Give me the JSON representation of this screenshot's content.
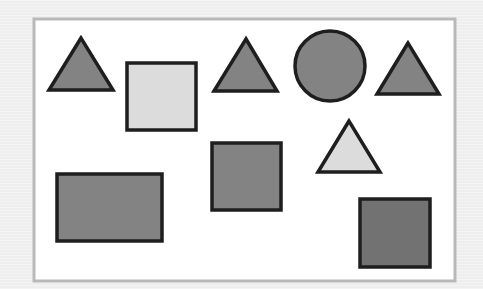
{
  "scene": {
    "background": "#eeeeee",
    "frame": {
      "x": 34,
      "y": 19,
      "width": 421,
      "height": 262,
      "fill": "#ffffff",
      "stroke": "#b9b9b9",
      "stroke_width": 3
    },
    "outline_color": "#1e1e1e",
    "outline_width": 3.5,
    "colors": {
      "medium_gray": "#838383",
      "dark_gray": "#727272",
      "light_gray": "#dcdcdc"
    },
    "shapes": [
      {
        "id": "triangle-1",
        "type": "triangle",
        "shade": "medium",
        "fill": "#838383",
        "points": "81,38 49,90 113,90"
      },
      {
        "id": "square-light",
        "type": "square",
        "shade": "light",
        "fill": "#dcdcdc",
        "x": 127,
        "y": 63,
        "width": 69,
        "height": 67
      },
      {
        "id": "triangle-2",
        "type": "triangle",
        "shade": "medium",
        "fill": "#838383",
        "points": "246,39 214,91 277,91"
      },
      {
        "id": "circle-1",
        "type": "circle",
        "shade": "medium",
        "fill": "#838383",
        "cx": 330,
        "cy": 66,
        "r": 35
      },
      {
        "id": "triangle-3",
        "type": "triangle",
        "shade": "medium",
        "fill": "#838383",
        "points": "408,43 377,94 439,94"
      },
      {
        "id": "triangle-light",
        "type": "triangle",
        "shade": "light",
        "fill": "#dcdcdc",
        "points": "349,121 318,172 380,172"
      },
      {
        "id": "square-middle",
        "type": "square",
        "shade": "medium",
        "fill": "#838383",
        "x": 212,
        "y": 143,
        "width": 69,
        "height": 67
      },
      {
        "id": "rectangle-wide",
        "type": "rectangle",
        "shade": "medium",
        "fill": "#838383",
        "x": 57,
        "y": 174,
        "width": 105,
        "height": 67
      },
      {
        "id": "square-dark",
        "type": "square",
        "shade": "dark",
        "fill": "#727272",
        "x": 360,
        "y": 199,
        "width": 70,
        "height": 68
      }
    ]
  }
}
